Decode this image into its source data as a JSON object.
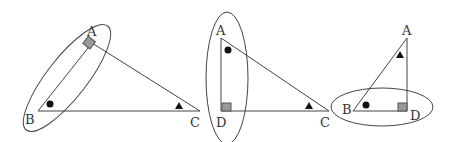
{
  "colors": {
    "stroke": "#444444",
    "marker_fill": "#111111",
    "square_fill": "#999999",
    "square_stroke": "#555555",
    "label": "#333333"
  },
  "figures": [
    {
      "name": "triangle-abc",
      "vertices": {
        "A": [
          92,
          43
        ],
        "B": [
          38,
          111
        ],
        "C": [
          200,
          111
        ]
      },
      "labels": [
        {
          "text": "A",
          "x": 87,
          "y": 36
        },
        {
          "text": "B",
          "x": 25,
          "y": 124
        },
        {
          "text": "C",
          "x": 190,
          "y": 127
        }
      ],
      "right_angle_at": "A",
      "dot_near": "B",
      "triangle_marker_near": "C",
      "ellipse": {
        "cx": 67,
        "cy": 78,
        "rx": 20,
        "ry": 66,
        "rotate": 38
      }
    },
    {
      "name": "triangle-adc",
      "vertices": {
        "A": [
          221,
          38
        ],
        "D": [
          221,
          111
        ],
        "C": [
          329,
          111
        ]
      },
      "labels": [
        {
          "text": "A",
          "x": 216,
          "y": 35
        },
        {
          "text": "D",
          "x": 216,
          "y": 127
        },
        {
          "text": "C",
          "x": 320,
          "y": 127
        }
      ],
      "right_angle_at": "D",
      "dot_near": "A",
      "triangle_marker_near": "C",
      "ellipse": {
        "cx": 227,
        "cy": 78,
        "rx": 21,
        "ry": 66,
        "rotate": 0
      }
    },
    {
      "name": "triangle-abd",
      "vertices": {
        "A": [
          407,
          38
        ],
        "B": [
          353,
          111
        ],
        "D": [
          407,
          111
        ]
      },
      "labels": [
        {
          "text": "A",
          "x": 402,
          "y": 35
        },
        {
          "text": "B",
          "x": 342,
          "y": 114
        },
        {
          "text": "D",
          "x": 410,
          "y": 120
        }
      ],
      "right_angle_at": "D",
      "dot_near": "B",
      "triangle_marker_near": "A",
      "ellipse": {
        "cx": 382,
        "cy": 107,
        "rx": 51,
        "ry": 19,
        "rotate": 0
      }
    }
  ]
}
